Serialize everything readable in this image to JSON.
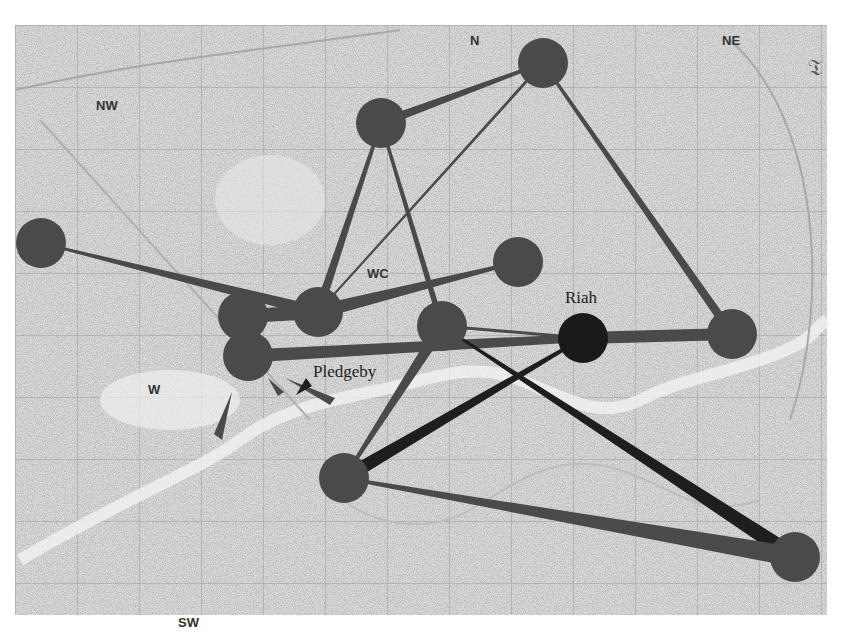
{
  "figure": {
    "background": "historic-map-of-london",
    "corner_glyph": "𝔗"
  },
  "map": {
    "district_labels": [
      "NW",
      "N",
      "NE",
      "W",
      "WC",
      "SW"
    ]
  },
  "colors": {
    "node_default": "#4a4a4a",
    "node_highlight": "#1a1a1a",
    "edge_default": "#4a4a4a",
    "edge_dark": "#1e1e1e",
    "map_paper": "#d9d9d9",
    "map_ink": "#8a8a8a"
  },
  "nodes": [
    {
      "id": "n1",
      "label": ""
    },
    {
      "id": "n2",
      "label": ""
    },
    {
      "id": "n3",
      "label": ""
    },
    {
      "id": "n4",
      "label": ""
    },
    {
      "id": "n5",
      "label": ""
    },
    {
      "id": "n6",
      "label": ""
    },
    {
      "id": "n7",
      "label": "Pledgeby"
    },
    {
      "id": "n8",
      "label": ""
    },
    {
      "id": "n9",
      "label": "Riah"
    },
    {
      "id": "n10",
      "label": ""
    },
    {
      "id": "n11",
      "label": ""
    },
    {
      "id": "n12",
      "label": ""
    }
  ],
  "edges": [
    {
      "from": "n1",
      "to": "n5",
      "style": "default"
    },
    {
      "from": "n2",
      "to": "n5",
      "style": "default"
    },
    {
      "from": "n2",
      "to": "n8",
      "style": "default"
    },
    {
      "from": "n2",
      "to": "n3",
      "style": "default"
    },
    {
      "from": "n3",
      "to": "n5",
      "style": "default"
    },
    {
      "from": "n3",
      "to": "n10",
      "style": "default"
    },
    {
      "from": "n4",
      "to": "n5",
      "style": "default"
    },
    {
      "from": "n6",
      "to": "n5",
      "style": "default"
    },
    {
      "from": "n7",
      "to": "n9",
      "style": "default"
    },
    {
      "from": "n8",
      "to": "n9",
      "style": "default"
    },
    {
      "from": "n8",
      "to": "n11",
      "style": "default"
    },
    {
      "from": "n8",
      "to": "n12",
      "style": "dark"
    },
    {
      "from": "n9",
      "to": "n10",
      "style": "default"
    },
    {
      "from": "n9",
      "to": "n11",
      "style": "dark"
    },
    {
      "from": "n11",
      "to": "n12",
      "style": "default"
    }
  ],
  "labels": {
    "pledgeby": "Pledgeby",
    "riah": "Riah"
  }
}
